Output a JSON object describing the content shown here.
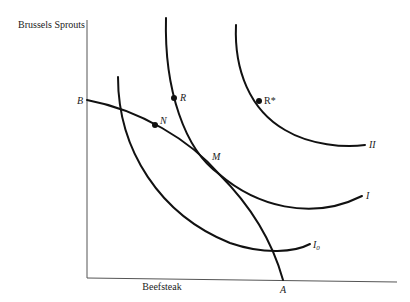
{
  "diagram": {
    "type": "indifference-curve-budget-line",
    "y_axis_label": "Brussels Sprouts",
    "x_axis_label": "Beefsteak",
    "budget_line": {
      "endpoints": [
        "B",
        "A"
      ]
    },
    "curves": [
      {
        "id": "I0",
        "label": "I",
        "subscript": "0"
      },
      {
        "id": "I",
        "label": "I"
      },
      {
        "id": "II",
        "label": "II"
      }
    ],
    "points": [
      {
        "id": "B",
        "label": "B"
      },
      {
        "id": "A",
        "label": "A"
      },
      {
        "id": "N",
        "label": "N"
      },
      {
        "id": "M",
        "label": "M"
      },
      {
        "id": "R",
        "label": "R"
      },
      {
        "id": "Rstar",
        "label": "R*"
      }
    ],
    "colors": {
      "ink": "#111111",
      "axis": "#555555",
      "background": "#ffffff"
    }
  }
}
